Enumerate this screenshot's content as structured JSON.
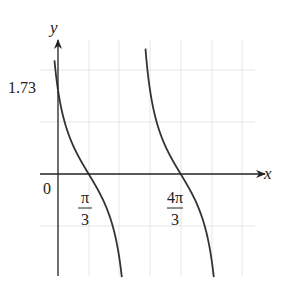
{
  "chart_data": {
    "type": "line",
    "title": "",
    "function": "y = cot(x + π/6)",
    "xlabel": "x",
    "ylabel": "y",
    "origin_label": "0",
    "y_tick_labels": [
      {
        "value": 1.73,
        "label": "1.73"
      }
    ],
    "x_tick_labels": [
      {
        "value": 1.0472,
        "num": "π",
        "den": "3"
      },
      {
        "value": 4.1888,
        "num": "4π",
        "den": "3"
      }
    ],
    "x_zeros": [
      1.0472,
      4.1888
    ],
    "y_intercept": 1.73,
    "period": 3.1416,
    "asymptotes": [
      -0.5236,
      2.618,
      5.7596
    ],
    "grid": true,
    "legend": null
  },
  "colors": {
    "curve": "#333333",
    "axis": "#222222",
    "grid": "#e6e6e6"
  }
}
